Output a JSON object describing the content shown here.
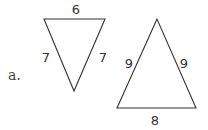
{
  "part_label": "a.",
  "triangles": [
    {
      "name": "inverted-triangle",
      "sides": {
        "top": "6",
        "left": "7",
        "right": "7"
      }
    },
    {
      "name": "upright-triangle",
      "sides": {
        "left": "9",
        "right": "9",
        "bottom": "8"
      }
    }
  ],
  "colors": {
    "stroke": "#333333",
    "text": "#333333"
  }
}
